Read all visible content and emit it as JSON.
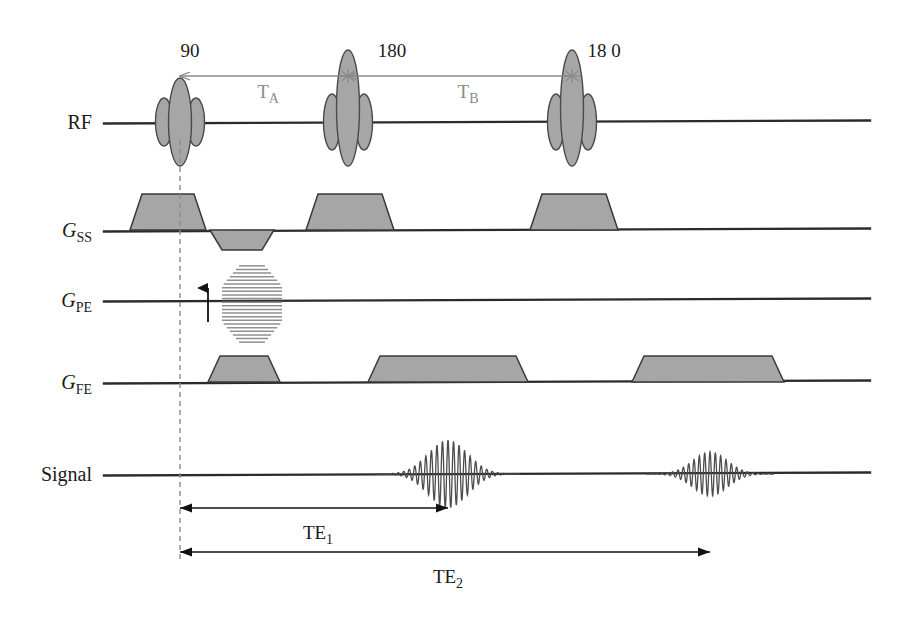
{
  "figure": {
    "background_color": "#ffffff",
    "width": 923,
    "height": 624,
    "fill_color": "#a6a6a6",
    "line_color": "#2b2b2b",
    "annotation_color": "#8a8a8a"
  },
  "channels": [
    {
      "id": "rf",
      "label": "RF",
      "label_plain": "RF",
      "italic": "",
      "subscript": "",
      "baseline_y": 122
    },
    {
      "id": "gss",
      "label": "G",
      "label_plain": "GSS",
      "italic": "G",
      "subscript": "SS",
      "baseline_y": 230
    },
    {
      "id": "gpe",
      "label": "G",
      "label_plain": "GPE",
      "italic": "G",
      "subscript": "PE",
      "baseline_y": 300
    },
    {
      "id": "gfe",
      "label": "G",
      "label_plain": "GFE",
      "italic": "G",
      "subscript": "FE",
      "baseline_y": 382
    },
    {
      "id": "signal",
      "label": "Signal",
      "label_plain": "Signal",
      "italic": "",
      "subscript": "",
      "baseline_y": 474
    }
  ],
  "rf_pulses": [
    {
      "name": "excitation-pulse",
      "flip_angle_label": "90",
      "label_x": 190,
      "label_y": 57,
      "center_x": 180,
      "main_ry": 44,
      "side_ry": 24,
      "top_extends_above": false
    },
    {
      "name": "refocusing-pulse-1",
      "flip_angle_label": "180",
      "label_x": 392,
      "label_y": 57,
      "center_x": 348,
      "main_ry": 58,
      "side_ry": 28,
      "top_extends_above": true
    },
    {
      "name": "refocusing-pulse-2",
      "flip_angle_label": "18 0",
      "label_x": 604,
      "label_y": 57,
      "center_x": 572,
      "main_ry": 58,
      "side_ry": 28,
      "top_extends_above": true
    }
  ],
  "intervals": [
    {
      "name": "T-A",
      "label": "T",
      "subscript": "A",
      "label_x": 268,
      "label_y": 98,
      "from_x": 348,
      "to_x": 180,
      "y": 76
    },
    {
      "name": "T-B",
      "label": "T",
      "subscript": "B",
      "label_x": 468,
      "label_y": 98,
      "from_x": 572,
      "to_x": 348,
      "y": 76
    }
  ],
  "gss_lobes": [
    {
      "name": "slice-select-90",
      "x1": 130,
      "x2": 206,
      "flat1": 142,
      "flat2": 194,
      "height": 36,
      "polarity": "positive"
    },
    {
      "name": "slice-rephase",
      "x1": 210,
      "x2": 274,
      "flat1": 222,
      "flat2": 262,
      "height": -20,
      "polarity": "negative"
    },
    {
      "name": "slice-select-180a",
      "x1": 306,
      "x2": 394,
      "flat1": 318,
      "flat2": 382,
      "height": 36,
      "polarity": "positive"
    },
    {
      "name": "slice-select-180b",
      "x1": 530,
      "x2": 618,
      "flat1": 542,
      "flat2": 606,
      "height": 36,
      "polarity": "positive"
    }
  ],
  "gpe_stack": {
    "name": "phase-encode-blips",
    "x1": 222,
    "x2": 282,
    "top_y": 264,
    "bottom_y": 344,
    "num_lines": 22,
    "arrow_x": 208,
    "arrow_from_y": 322,
    "arrow_to_y": 288
  },
  "gfe_lobes": [
    {
      "name": "readout-dephase",
      "x1": 208,
      "x2": 280,
      "flat1": 220,
      "flat2": 268,
      "height": 26
    },
    {
      "name": "readout-echo-1",
      "x1": 368,
      "x2": 528,
      "flat1": 380,
      "flat2": 516,
      "height": 26
    },
    {
      "name": "readout-echo-2",
      "x1": 632,
      "x2": 784,
      "flat1": 644,
      "flat2": 772,
      "height": 26
    }
  ],
  "echoes": [
    {
      "name": "echo-1",
      "center_x": 448,
      "half_width": 72,
      "amplitude": 34,
      "cycles": 13,
      "decay": 2.6
    },
    {
      "name": "echo-2",
      "center_x": 710,
      "half_width": 64,
      "amplitude": 22,
      "cycles": 12,
      "decay": 2.6
    }
  ],
  "timing_markers": {
    "excitation_dash_x": 180,
    "dash_top_y": 140,
    "dash_bottom_y": 560
  },
  "te_measures": [
    {
      "name": "te-1",
      "label": "TE",
      "subscript": "1",
      "from_x": 180,
      "to_x": 448,
      "y": 508,
      "label_x": 318,
      "label_y": 539
    },
    {
      "name": "te-2",
      "label": "TE",
      "subscript": "2",
      "from_x": 180,
      "to_x": 710,
      "y": 552,
      "label_x": 448,
      "label_y": 583
    }
  ]
}
